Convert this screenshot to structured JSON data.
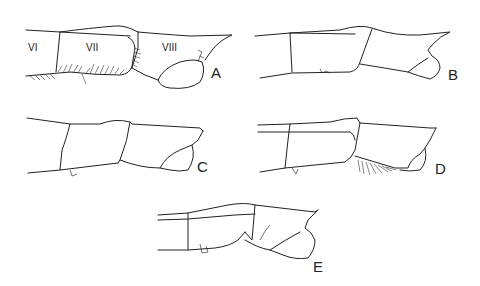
{
  "figure": {
    "panels": [
      {
        "id": "A",
        "label": "A",
        "segments": [
          "VI",
          "VII",
          "VIII"
        ]
      },
      {
        "id": "B",
        "label": "B"
      },
      {
        "id": "C",
        "label": "C"
      },
      {
        "id": "D",
        "label": "D"
      },
      {
        "id": "E",
        "label": "E"
      }
    ],
    "line_color": "#222222",
    "background": "#ffffff"
  }
}
